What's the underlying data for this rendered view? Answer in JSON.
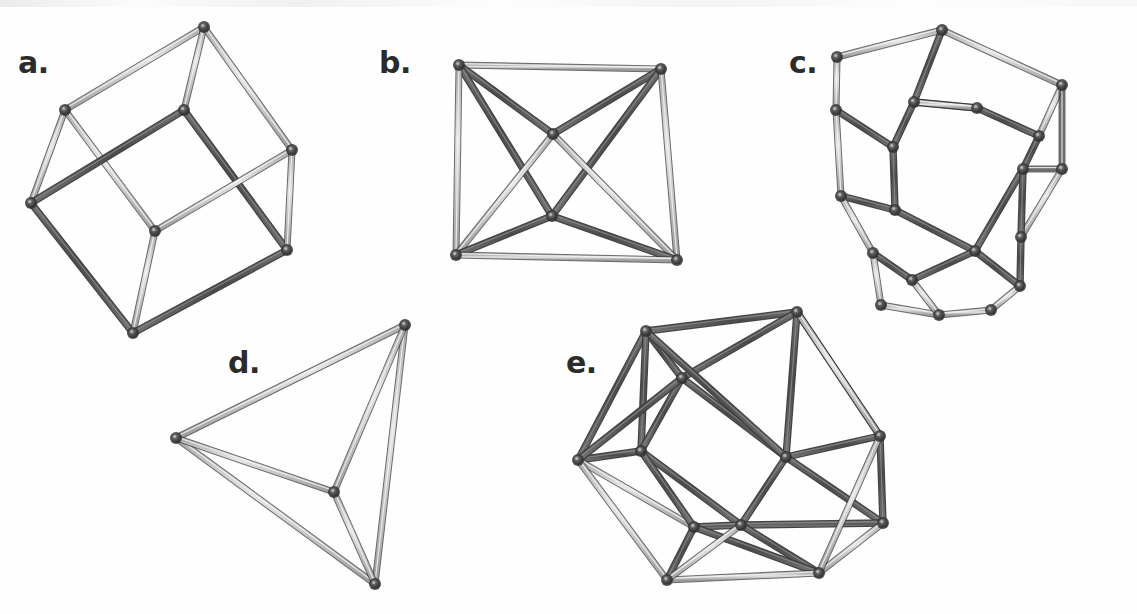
{
  "figure": {
    "background_color": "#fefefe",
    "width": 1137,
    "height": 614,
    "strut_dark_color": "#545454",
    "strut_light_color": "#b8b8b8",
    "strut_outline_color": "#3a3a3a",
    "joint_color": "#4a4a4a",
    "label_color": "#2b2b2b"
  },
  "panels": [
    {
      "id": "a",
      "label": "a.",
      "solid_name": "cube",
      "label_x": 18,
      "label_y": 48,
      "vertex_count": 8,
      "edge_count": 12,
      "face_count": 6,
      "vertices": [
        [
          204,
          27
        ],
        [
          65,
          110
        ],
        [
          184,
          110
        ],
        [
          292,
          150
        ],
        [
          31,
          203
        ],
        [
          155,
          231
        ],
        [
          287,
          250
        ],
        [
          133,
          333
        ]
      ],
      "edges": [
        [
          0,
          1,
          "light"
        ],
        [
          0,
          2,
          "light"
        ],
        [
          0,
          3,
          "light"
        ],
        [
          1,
          4,
          "light"
        ],
        [
          1,
          5,
          "light"
        ],
        [
          2,
          4,
          "dark"
        ],
        [
          2,
          6,
          "dark"
        ],
        [
          3,
          5,
          "light"
        ],
        [
          3,
          6,
          "light"
        ],
        [
          4,
          7,
          "dark"
        ],
        [
          5,
          7,
          "light"
        ],
        [
          6,
          7,
          "dark"
        ]
      ]
    },
    {
      "id": "b",
      "label": "b.",
      "solid_name": "octahedron",
      "label_x": 379,
      "label_y": 48,
      "vertex_count": 6,
      "edge_count": 12,
      "face_count": 8,
      "vertices": [
        [
          459,
          65
        ],
        [
          661,
          69
        ],
        [
          553,
          134
        ],
        [
          552,
          216
        ],
        [
          456,
          255
        ],
        [
          677,
          260
        ]
      ],
      "edges": [
        [
          0,
          1,
          "light"
        ],
        [
          0,
          2,
          "dark"
        ],
        [
          0,
          3,
          "dark"
        ],
        [
          0,
          4,
          "light"
        ],
        [
          1,
          2,
          "dark"
        ],
        [
          1,
          3,
          "dark"
        ],
        [
          1,
          5,
          "light"
        ],
        [
          2,
          4,
          "light"
        ],
        [
          2,
          5,
          "light"
        ],
        [
          3,
          4,
          "dark"
        ],
        [
          3,
          5,
          "dark"
        ],
        [
          4,
          5,
          "light"
        ]
      ]
    },
    {
      "id": "c",
      "label": "c.",
      "solid_name": "dodecahedron",
      "label_x": 789,
      "label_y": 48,
      "vertex_count": 20,
      "edge_count": 30,
      "face_count": 12,
      "vertices": [
        [
          942,
          30
        ],
        [
          914,
          102
        ],
        [
          977,
          108
        ],
        [
          1062,
          85
        ],
        [
          837,
          57
        ],
        [
          836,
          110
        ],
        [
          893,
          147
        ],
        [
          1039,
          136
        ],
        [
          1062,
          169
        ],
        [
          841,
          196
        ],
        [
          895,
          210
        ],
        [
          1023,
          169
        ],
        [
          1021,
          237
        ],
        [
          873,
          253
        ],
        [
          912,
          280
        ],
        [
          975,
          251
        ],
        [
          1020,
          286
        ],
        [
          881,
          305
        ],
        [
          939,
          315
        ],
        [
          991,
          310
        ]
      ],
      "edges": [
        [
          0,
          4,
          "light"
        ],
        [
          0,
          3,
          "light"
        ],
        [
          0,
          1,
          "dark"
        ],
        [
          4,
          5,
          "light"
        ],
        [
          5,
          6,
          "dark"
        ],
        [
          1,
          6,
          "dark"
        ],
        [
          1,
          2,
          "dark"
        ],
        [
          2,
          7,
          "dark"
        ],
        [
          3,
          7,
          "light"
        ],
        [
          3,
          8,
          "light"
        ],
        [
          7,
          11,
          "dark"
        ],
        [
          8,
          11,
          "light"
        ],
        [
          5,
          9,
          "light"
        ],
        [
          6,
          10,
          "dark"
        ],
        [
          9,
          10,
          "dark"
        ],
        [
          9,
          13,
          "light"
        ],
        [
          10,
          15,
          "dark"
        ],
        [
          11,
          15,
          "dark"
        ],
        [
          8,
          12,
          "light"
        ],
        [
          11,
          12,
          "dark"
        ],
        [
          12,
          16,
          "dark"
        ],
        [
          13,
          14,
          "dark"
        ],
        [
          13,
          17,
          "light"
        ],
        [
          14,
          15,
          "dark"
        ],
        [
          15,
          16,
          "dark"
        ],
        [
          16,
          19,
          "light"
        ],
        [
          17,
          18,
          "light"
        ],
        [
          14,
          18,
          "light"
        ],
        [
          18,
          19,
          "light"
        ],
        [
          2,
          1,
          "light"
        ]
      ]
    },
    {
      "id": "d",
      "label": "d.",
      "solid_name": "tetrahedron",
      "label_x": 228,
      "label_y": 348,
      "vertex_count": 4,
      "edge_count": 6,
      "face_count": 4,
      "vertices": [
        [
          405,
          325
        ],
        [
          176,
          438
        ],
        [
          375,
          584
        ],
        [
          334,
          492
        ]
      ],
      "edges": [
        [
          0,
          1,
          "light"
        ],
        [
          0,
          2,
          "light"
        ],
        [
          0,
          3,
          "light"
        ],
        [
          1,
          2,
          "light"
        ],
        [
          1,
          3,
          "light"
        ],
        [
          2,
          3,
          "light"
        ]
      ]
    },
    {
      "id": "e",
      "label": "e.",
      "solid_name": "icosahedron",
      "label_x": 566,
      "label_y": 348,
      "vertex_count": 12,
      "edge_count": 30,
      "face_count": 20,
      "vertices": [
        [
          646,
          331
        ],
        [
          797,
          312
        ],
        [
          682,
          378
        ],
        [
          880,
          436
        ],
        [
          578,
          460
        ],
        [
          786,
          457
        ],
        [
          641,
          451
        ],
        [
          741,
          525
        ],
        [
          883,
          523
        ],
        [
          694,
          527
        ],
        [
          819,
          573
        ],
        [
          667,
          580
        ]
      ],
      "edges": [
        [
          0,
          1,
          "dark"
        ],
        [
          0,
          2,
          "dark"
        ],
        [
          0,
          4,
          "dark"
        ],
        [
          0,
          6,
          "dark"
        ],
        [
          1,
          2,
          "dark"
        ],
        [
          1,
          3,
          "dark"
        ],
        [
          1,
          5,
          "dark"
        ],
        [
          2,
          5,
          "dark"
        ],
        [
          2,
          6,
          "dark"
        ],
        [
          3,
          5,
          "dark"
        ],
        [
          3,
          8,
          "dark"
        ],
        [
          3,
          1,
          "light"
        ],
        [
          4,
          6,
          "dark"
        ],
        [
          4,
          9,
          "light"
        ],
        [
          4,
          11,
          "light"
        ],
        [
          5,
          7,
          "dark"
        ],
        [
          5,
          8,
          "dark"
        ],
        [
          6,
          7,
          "dark"
        ],
        [
          6,
          9,
          "dark"
        ],
        [
          7,
          8,
          "dark"
        ],
        [
          7,
          9,
          "dark"
        ],
        [
          7,
          10,
          "dark"
        ],
        [
          8,
          10,
          "light"
        ],
        [
          9,
          11,
          "dark"
        ],
        [
          9,
          10,
          "dark"
        ],
        [
          10,
          11,
          "light"
        ],
        [
          0,
          5,
          "dark"
        ],
        [
          2,
          4,
          "dark"
        ],
        [
          3,
          10,
          "light"
        ],
        [
          11,
          7,
          "light"
        ]
      ]
    }
  ]
}
